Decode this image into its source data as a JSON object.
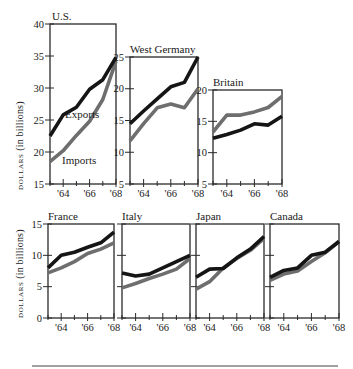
{
  "chart_data": [
    {
      "type": "line",
      "title": "U.S.",
      "x": [
        "'63",
        "'64",
        "'65",
        "'66",
        "'67",
        "'68"
      ],
      "xticks": [
        "'64",
        "'66",
        "'68"
      ],
      "ylabel": "DOLLARS (in billions)",
      "ylim": [
        15,
        40
      ],
      "yticks": [
        15,
        20,
        25,
        30,
        35,
        40
      ],
      "series": [
        {
          "name": "Exports",
          "values": [
            22.5,
            25.8,
            27.0,
            29.8,
            31.3,
            34.8
          ]
        },
        {
          "name": "Imports",
          "values": [
            18.5,
            20.2,
            22.6,
            24.8,
            28.2,
            34.2
          ]
        }
      ],
      "annotations": [
        "Exports",
        "Imports"
      ]
    },
    {
      "type": "line",
      "title": "West Germany",
      "x": [
        "'63",
        "'64",
        "'65",
        "'66",
        "'67",
        "'68"
      ],
      "xticks": [
        "'64",
        "'66",
        "'68"
      ],
      "ylim": [
        5,
        25
      ],
      "yticks": [
        5,
        10,
        15,
        20,
        25
      ],
      "series": [
        {
          "name": "Exports",
          "values": [
            14.5,
            16.5,
            18.4,
            20.3,
            21.0,
            25.0
          ]
        },
        {
          "name": "Imports",
          "values": [
            11.8,
            14.5,
            17.0,
            17.6,
            17.0,
            20.0
          ]
        }
      ]
    },
    {
      "type": "line",
      "title": "Britain",
      "x": [
        "'63",
        "'64",
        "'65",
        "'66",
        "'67",
        "'68"
      ],
      "xticks": [
        "'64",
        "'66",
        "'68"
      ],
      "ylim": [
        5,
        20
      ],
      "yticks": [
        5,
        10,
        15,
        20
      ],
      "series": [
        {
          "name": "Exports",
          "values": [
            12.3,
            12.9,
            13.6,
            14.6,
            14.4,
            15.8
          ]
        },
        {
          "name": "Imports",
          "values": [
            13.3,
            16.0,
            16.0,
            16.5,
            17.2,
            19.0
          ]
        }
      ]
    },
    {
      "type": "line",
      "title": "France",
      "x": [
        "'63",
        "'64",
        "'65",
        "'66",
        "'67",
        "'68"
      ],
      "xticks": [
        "'64",
        "'66",
        "'68"
      ],
      "ylabel": "DOLLARS (in billions)",
      "ylim": [
        0,
        15
      ],
      "yticks": [
        0,
        5,
        10,
        15
      ],
      "series": [
        {
          "name": "Exports",
          "values": [
            8.0,
            10.0,
            10.5,
            11.3,
            12.0,
            13.7
          ]
        },
        {
          "name": "Imports",
          "values": [
            7.2,
            8.0,
            9.0,
            10.3,
            11.0,
            12.0
          ]
        }
      ]
    },
    {
      "type": "line",
      "title": "Italy",
      "x": [
        "'63",
        "'64",
        "'65",
        "'66",
        "'67",
        "'68"
      ],
      "xticks": [
        "'64",
        "'66",
        "'68"
      ],
      "ylim": [
        0,
        15
      ],
      "yticks": [
        0,
        5,
        10,
        15
      ],
      "series": [
        {
          "name": "Exports",
          "values": [
            7.2,
            6.7,
            7.0,
            8.0,
            9.0,
            10.0
          ]
        },
        {
          "name": "Imports",
          "values": [
            4.8,
            5.5,
            6.3,
            7.0,
            7.8,
            9.5
          ]
        }
      ]
    },
    {
      "type": "line",
      "title": "Japan",
      "x": [
        "'63",
        "'64",
        "'65",
        "'66",
        "'67",
        "'68"
      ],
      "xticks": [
        "'64",
        "'66",
        "'68"
      ],
      "ylim": [
        0,
        15
      ],
      "yticks": [
        0,
        5,
        10,
        15
      ],
      "series": [
        {
          "name": "Exports",
          "values": [
            6.5,
            7.8,
            7.9,
            9.6,
            11.0,
            13.0
          ]
        },
        {
          "name": "Imports",
          "values": [
            4.6,
            5.8,
            8.0,
            9.5,
            10.8,
            12.7
          ]
        }
      ]
    },
    {
      "type": "line",
      "title": "Canada",
      "x": [
        "'63",
        "'64",
        "'65",
        "'66",
        "'67",
        "'68"
      ],
      "xticks": [
        "'64",
        "'66",
        "'68"
      ],
      "ylim": [
        0,
        15
      ],
      "yticks": [
        0,
        5,
        10,
        15
      ],
      "series": [
        {
          "name": "Exports",
          "values": [
            6.5,
            7.6,
            8.0,
            10.0,
            10.5,
            12.2
          ]
        },
        {
          "name": "Imports",
          "values": [
            6.0,
            7.0,
            7.5,
            9.0,
            10.4,
            12.2
          ]
        }
      ]
    }
  ],
  "style": {
    "exports_color": "#151515",
    "imports_color": "#6e6e6e",
    "frame_color": "#2a2a2a"
  },
  "labels": {
    "ylabel_top_sc": "DOLLARS",
    "ylabel_top_rest": " (in billions)",
    "ylabel_bottom_sc": "DOLLARS",
    "ylabel_bottom_rest": " (in billions)"
  }
}
